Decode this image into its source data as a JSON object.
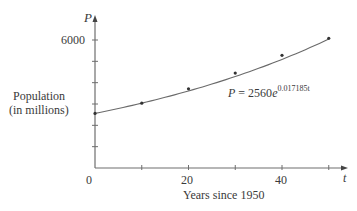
{
  "chart_data": {
    "type": "scatter",
    "title": "",
    "xlabel": "Years since 1950",
    "ylabel": "Population (in millions)",
    "ylabel_lines": [
      "Population",
      "(in millions)"
    ],
    "x_axis_var": "t",
    "y_axis_var": "P",
    "x_ticks": [
      0,
      10,
      20,
      30,
      40,
      50
    ],
    "x_tick_labels": [
      "0",
      "20",
      "40"
    ],
    "y_ticks": [
      0,
      1000,
      2000,
      3000,
      4000,
      5000,
      6000
    ],
    "y_tick_labels": [
      "6000"
    ],
    "xlim": [
      0,
      53
    ],
    "ylim": [
      0,
      6900
    ],
    "grid": false,
    "legend": null,
    "series": [
      {
        "name": "Observed population",
        "kind": "scatter",
        "x": [
          0,
          10,
          20,
          30,
          40,
          50
        ],
        "y": [
          2560,
          3040,
          3710,
          4450,
          5280,
          6080
        ]
      },
      {
        "name": "Exponential model",
        "kind": "line",
        "equation": "P = 2560e^(0.017185t)",
        "coefficient": 2560,
        "rate": 0.017185
      }
    ],
    "annotations": [
      {
        "text": "P = 2560e^0.017185t",
        "x": 33,
        "y": 3500
      }
    ]
  },
  "labels": {
    "y_var": "P",
    "x_var": "t",
    "y_tick_6000": "6000",
    "x_tick_0": "0",
    "x_tick_20": "20",
    "x_tick_40": "40",
    "ylabel_line1": "Population",
    "ylabel_line2": "(in millions)",
    "xlabel": "Years since 1950",
    "eq_lhs": "P",
    "eq_mid": " = 2560",
    "eq_e": "e",
    "eq_exp": "0.017185t"
  }
}
